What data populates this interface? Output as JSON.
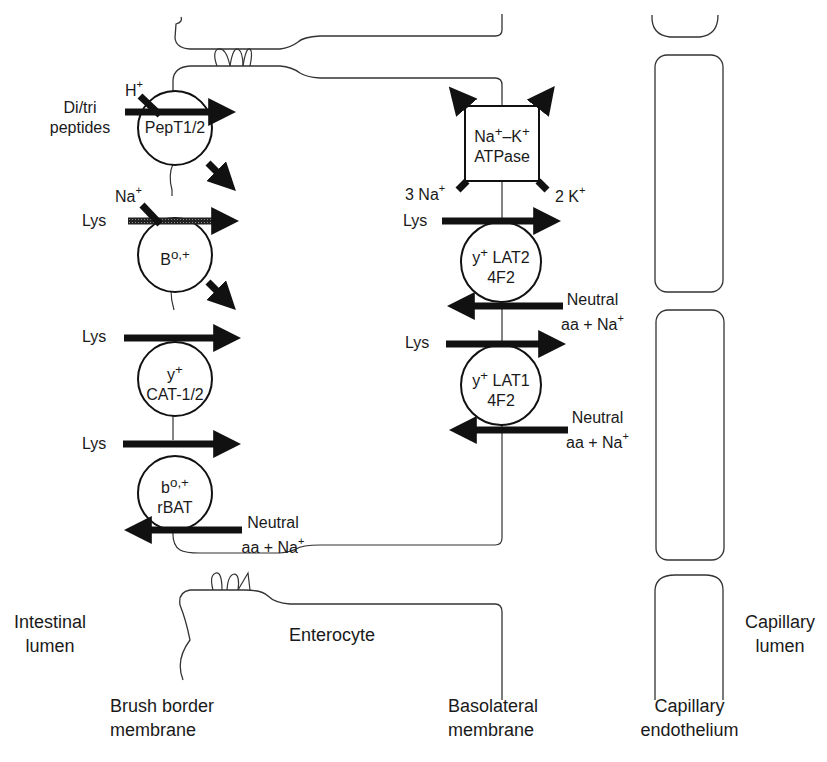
{
  "regions": {
    "intestinal_lumen": [
      "Intestinal",
      "lumen"
    ],
    "enterocyte": "Enterocyte",
    "capillary_lumen": [
      "Capillary",
      "lumen"
    ],
    "brush_border": [
      "Brush border",
      "membrane"
    ],
    "basolateral": [
      "Basolateral",
      "membrane"
    ],
    "capillary_endothelium": [
      "Capillary",
      "endothelium"
    ]
  },
  "brush_border_transporters": [
    {
      "name": "PepT1/2",
      "substrate": [
        "Di/tri",
        "peptides"
      ],
      "cotransported_ion": "H",
      "ion_charge": "+"
    },
    {
      "name_base": "B",
      "name_sup": "o,+",
      "substrate": "Lys",
      "cotransported_ion": "Na",
      "ion_charge": "+"
    },
    {
      "name_base": "y",
      "name_sup": "+",
      "name_line2": "CAT-1/2",
      "substrate": "Lys"
    },
    {
      "name_base": "b",
      "name_sup": "o,+",
      "name_line2": "rBAT",
      "substrate": "Lys",
      "exchange_out": [
        "Neutral",
        "aa + Na"
      ],
      "exchange_charge": "+"
    }
  ],
  "basolateral_transporters": [
    {
      "pump_line1": "Na",
      "pump_sup1": "+",
      "pump_dash": "–K",
      "pump_sup2": "+",
      "pump_line2": "ATPase",
      "left_ion": "3 Na",
      "right_ion": "2 K",
      "ion_charge": "+"
    },
    {
      "name_base": "y",
      "name_sup": "+",
      "name_rest": "LAT2",
      "name_line2": "4F2",
      "substrate": "Lys",
      "exchange_in": [
        "Neutral",
        "aa + Na"
      ],
      "exchange_charge": "+"
    },
    {
      "name_base": "y",
      "name_sup": "+",
      "name_rest": "LAT1",
      "name_line2": "4F2",
      "substrate": "Lys",
      "exchange_in": [
        "Neutral",
        "aa + Na"
      ],
      "exchange_charge": "+"
    }
  ],
  "colors": {
    "line": "#1a1a1a",
    "arrow": "#111111",
    "hatched_arrow": "#4a4a4a",
    "background": "#ffffff"
  }
}
